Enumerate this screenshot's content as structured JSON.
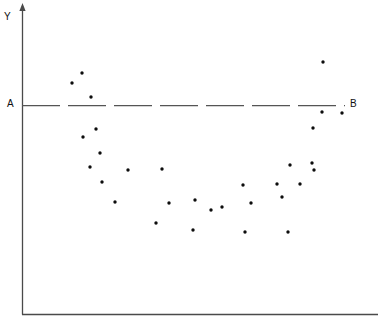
{
  "figure": {
    "labels": {
      "y_axis": "Y",
      "line_left": "A",
      "line_right": "B"
    },
    "colors": {
      "axis": "#4a4a4a",
      "point": "#0d0d0d",
      "reference_line": "#555555",
      "background": "#ffffff"
    }
  },
  "chart_data": {
    "type": "scatter",
    "title": "",
    "xlabel": "",
    "ylabel": "Y",
    "grid": false,
    "legend": null,
    "axis_style": {
      "y_axis_arrow": true,
      "x_axis_arrow": false,
      "y_axis_x_px": 22,
      "x_axis_y_px": 314,
      "x_axis_end_px": 378,
      "y_axis_top_px": 6
    },
    "annotations": [
      {
        "name": "reference-line-A-B",
        "type": "horizontal-dashed-line",
        "label_left": "A",
        "label_right": "B",
        "y_px": 105,
        "x_start_px": 22,
        "x_end_px": 345,
        "dash_count": 7
      }
    ],
    "points_px": [
      [
        82,
        73
      ],
      [
        72,
        83
      ],
      [
        91,
        97
      ],
      [
        96,
        129
      ],
      [
        83,
        137
      ],
      [
        100,
        153
      ],
      [
        90,
        167
      ],
      [
        128,
        170
      ],
      [
        102,
        182
      ],
      [
        115,
        202
      ],
      [
        162,
        169
      ],
      [
        195,
        200
      ],
      [
        169,
        203
      ],
      [
        211,
        210
      ],
      [
        222,
        207
      ],
      [
        156,
        223
      ],
      [
        193,
        230
      ],
      [
        290,
        165
      ],
      [
        243,
        185
      ],
      [
        277,
        184
      ],
      [
        300,
        184
      ],
      [
        282,
        197
      ],
      [
        251,
        203
      ],
      [
        245,
        232
      ],
      [
        288,
        232
      ],
      [
        323,
        62
      ],
      [
        322,
        112
      ],
      [
        342,
        113
      ],
      [
        313,
        128
      ],
      [
        312,
        163
      ],
      [
        314,
        170
      ]
    ],
    "x": [
      82,
      72,
      91,
      96,
      83,
      100,
      90,
      128,
      102,
      115,
      162,
      195,
      169,
      211,
      222,
      156,
      193,
      290,
      243,
      277,
      300,
      282,
      251,
      245,
      288,
      323,
      322,
      342,
      313,
      312,
      314
    ],
    "y": [
      73,
      83,
      97,
      129,
      137,
      153,
      167,
      170,
      182,
      202,
      169,
      200,
      203,
      210,
      207,
      223,
      230,
      165,
      185,
      184,
      184,
      197,
      203,
      232,
      232,
      62,
      112,
      113,
      128,
      163,
      170
    ],
    "n_points": 31,
    "pattern": "U-shaped / parabolic scatter: values high at left and right extremes, minimum near the horizontal center",
    "xlim_px": [
      22,
      378
    ],
    "ylim_px": [
      6,
      314
    ]
  }
}
